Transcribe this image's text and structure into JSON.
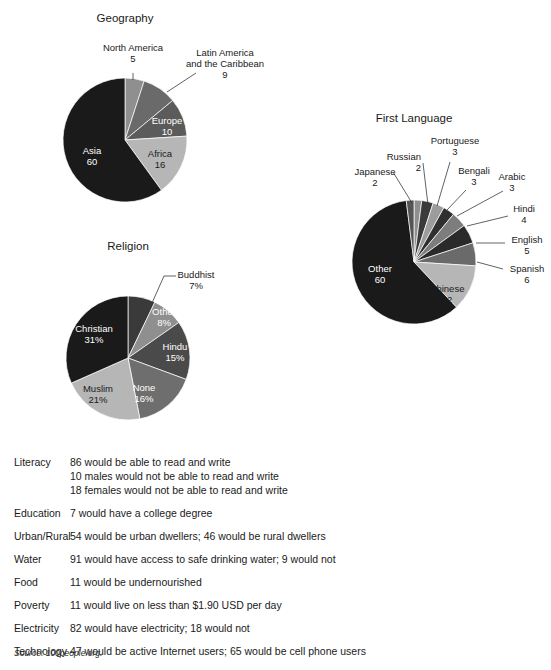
{
  "chart_data": [
    {
      "type": "pie",
      "title": "Geography",
      "name": "geography",
      "unit": "people per 100",
      "center": [
        125,
        140
      ],
      "radius": 62,
      "start_angle": -90,
      "categories": [
        "North America",
        "Latin America and the Caribbean",
        "Europe",
        "Africa",
        "Asia"
      ],
      "values": [
        5,
        9,
        10,
        16,
        60
      ],
      "colors": [
        "#8f8f8f",
        "#6a6a6a",
        "#5b5b5b",
        "#b6b6b6",
        "#1a1a1a"
      ],
      "slices": [
        {
          "label": "North America",
          "value": 5,
          "value_text": "5",
          "color": "#8f8f8f",
          "label_mode": "leader",
          "label_color": "#1a1a1a",
          "label_x": 133,
          "label_y": 51,
          "label_anchor": "middle",
          "leader": "M 133,73 L 133,80"
        },
        {
          "label": "Latin America",
          "label2": "and the Caribbean",
          "value": 9,
          "value_text": "9",
          "color": "#6a6a6a",
          "label_mode": "leader",
          "label_color": "#1a1a1a",
          "label_x": 225,
          "label_y": 56,
          "label_anchor": "middle",
          "leader": "M 167,92 L 196,73"
        },
        {
          "label": "Europe",
          "value": 10,
          "value_text": "10",
          "color": "#5b5b5b",
          "label_mode": "inside",
          "label_color": "#ffffff",
          "label_x": 167,
          "label_y": 124,
          "label_anchor": "middle"
        },
        {
          "label": "Africa",
          "value": 16,
          "value_text": "16",
          "color": "#b6b6b6",
          "label_mode": "inside",
          "label_color": "#1a1a1a",
          "label_x": 160,
          "label_y": 157,
          "label_anchor": "middle"
        },
        {
          "label": "Asia",
          "value": 60,
          "value_text": "60",
          "color": "#1a1a1a",
          "label_mode": "inside",
          "label_color": "#ffffff",
          "label_x": 92,
          "label_y": 154,
          "label_anchor": "middle"
        }
      ]
    },
    {
      "type": "pie",
      "title": "First Language",
      "name": "first-language",
      "unit": "people per 100",
      "center": [
        414,
        262
      ],
      "radius": 62,
      "start_angle": -90,
      "categories": [
        "Russian",
        "Portuguese",
        "Bengali",
        "Arabic",
        "Hindi",
        "English",
        "Spanish",
        "Chinese",
        "Other",
        "Japanese"
      ],
      "values": [
        2,
        3,
        3,
        3,
        4,
        5,
        6,
        12,
        60,
        2
      ],
      "colors": [
        "#8f8f8f",
        "#3a3a3a",
        "#9c9c9c",
        "#2f2f2f",
        "#7d7d7d",
        "#2a2a2a",
        "#6a6a6a",
        "#b6b6b6",
        "#1a1a1a",
        "#555555"
      ],
      "slices": [
        {
          "label": "Russian",
          "value": 2,
          "value_text": "2",
          "color": "#8f8f8f",
          "label_mode": "leader",
          "label_color": "#1a1a1a",
          "label_x": 421,
          "label_y": 160,
          "label_anchor": "end",
          "leader": "M 423,163 L 428,205"
        },
        {
          "label": "Portuguese",
          "value": 3,
          "value_text": "3",
          "color": "#3a3a3a",
          "label_mode": "leader",
          "label_color": "#1a1a1a",
          "label_x": 455,
          "label_y": 144,
          "label_anchor": "middle",
          "leader": "M 450,162 L 437,206"
        },
        {
          "label": "Bengali",
          "value": 3,
          "value_text": "3",
          "color": "#9c9c9c",
          "label_mode": "leader",
          "label_color": "#1a1a1a",
          "label_x": 474,
          "label_y": 174,
          "label_anchor": "middle",
          "leader": "M 466,190 L 447,210"
        },
        {
          "label": "Arabic",
          "value": 3,
          "value_text": "3",
          "color": "#2f2f2f",
          "label_mode": "leader",
          "label_color": "#1a1a1a",
          "label_x": 512,
          "label_y": 180,
          "label_anchor": "middle",
          "leader": "M 503,191 L 457,216"
        },
        {
          "label": "Hindi",
          "value": 4,
          "value_text": "4",
          "color": "#7d7d7d",
          "label_mode": "leader",
          "label_color": "#1a1a1a",
          "label_x": 524,
          "label_y": 212,
          "label_anchor": "middle",
          "leader": "M 508,216 L 467,226"
        },
        {
          "label": "English",
          "value": 5,
          "value_text": "5",
          "color": "#2a2a2a",
          "label_mode": "leader",
          "label_color": "#1a1a1a",
          "label_x": 527,
          "label_y": 243,
          "label_anchor": "middle",
          "leader": "M 505,243 L 476,243"
        },
        {
          "label": "Spanish",
          "value": 6,
          "value_text": "6",
          "color": "#6a6a6a",
          "label_mode": "leader",
          "label_color": "#1a1a1a",
          "label_x": 527,
          "label_y": 272,
          "label_anchor": "middle",
          "leader": "M 503,269 L 477,262"
        },
        {
          "label": "Chinese",
          "value": 12,
          "value_text": "12",
          "color": "#b6b6b6",
          "label_mode": "inside",
          "label_color": "#1a1a1a",
          "label_x": 447,
          "label_y": 292,
          "label_anchor": "middle"
        },
        {
          "label": "Other",
          "value": 60,
          "value_text": "60",
          "color": "#1a1a1a",
          "label_mode": "inside",
          "label_color": "#ffffff",
          "label_x": 380,
          "label_y": 272,
          "label_anchor": "middle"
        },
        {
          "label": "Japanese",
          "value": 2,
          "value_text": "2",
          "color": "#555555",
          "label_mode": "leader",
          "label_color": "#1a1a1a",
          "label_x": 375,
          "label_y": 175,
          "label_anchor": "middle",
          "leader": "M 393,172 L 412,203"
        }
      ]
    },
    {
      "type": "pie",
      "title": "Religion",
      "name": "religion",
      "unit": "percent",
      "center": [
        128,
        358
      ],
      "radius": 62,
      "start_angle": -90,
      "categories": [
        "Buddhist",
        "Other",
        "Hindu",
        "None",
        "Muslim",
        "Christian"
      ],
      "values": [
        7,
        8,
        15,
        16,
        21,
        31
      ],
      "value_texts": [
        "7%",
        "8%",
        "15%",
        "16%",
        "21%",
        "31%"
      ],
      "colors": [
        "#3a3a3a",
        "#8f8f8f",
        "#4a4a4a",
        "#6e6e6e",
        "#b6b6b6",
        "#1a1a1a"
      ],
      "slices": [
        {
          "label": "Buddhist",
          "value": 7,
          "value_text": "7%",
          "color": "#3a3a3a",
          "label_mode": "leader",
          "label_color": "#1a1a1a",
          "label_x": 196,
          "label_y": 278,
          "label_anchor": "middle",
          "leader": "M 176,276 L 164,276 L 152,303"
        },
        {
          "label": "Other",
          "value": 8,
          "value_text": "8%",
          "color": "#8f8f8f",
          "label_mode": "inside",
          "label_color": "#ffffff",
          "label_x": 164,
          "label_y": 315,
          "label_anchor": "middle"
        },
        {
          "label": "Hindu",
          "value": 15,
          "value_text": "15%",
          "color": "#4a4a4a",
          "label_mode": "inside",
          "label_color": "#ffffff",
          "label_x": 175,
          "label_y": 350,
          "label_anchor": "middle"
        },
        {
          "label": "None",
          "value": 16,
          "value_text": "16%",
          "color": "#6e6e6e",
          "label_mode": "inside",
          "label_color": "#ffffff",
          "label_x": 144,
          "label_y": 391,
          "label_anchor": "middle"
        },
        {
          "label": "Muslim",
          "value": 21,
          "value_text": "21%",
          "color": "#b6b6b6",
          "label_mode": "inside",
          "label_color": "#1a1a1a",
          "label_x": 98,
          "label_y": 392,
          "label_anchor": "middle"
        },
        {
          "label": "Christian",
          "value": 31,
          "value_text": "31%",
          "color": "#1a1a1a",
          "label_mode": "inside",
          "label_color": "#ffffff",
          "label_x": 94,
          "label_y": 332,
          "label_anchor": "middle"
        }
      ]
    }
  ],
  "stats": {
    "rows": [
      {
        "label": "Literacy",
        "values": [
          "86 would be able to read and write",
          "10 males would not be able to read and write",
          "18 females would not be able to read and write"
        ]
      },
      {
        "label": "Education",
        "values": [
          "7 would have a college degree"
        ]
      },
      {
        "label": "Urban/Rural",
        "values": [
          "54 would be urban dwellers; 46 would be rural dwellers"
        ]
      },
      {
        "label": "Water",
        "values": [
          "91 would have access to safe drinking water; 9 would not"
        ]
      },
      {
        "label": "Food",
        "values": [
          "11 would be undernourished"
        ]
      },
      {
        "label": "Poverty",
        "values": [
          "11 would live on less than $1.90 USD per day"
        ]
      },
      {
        "label": "Electricity",
        "values": [
          "82 would have electricity; 18 would not"
        ]
      },
      {
        "label": "Technology",
        "values": [
          "47 would be active Internet users; 65 would be cell phone users"
        ]
      }
    ]
  },
  "source": "Source: 100people.org."
}
